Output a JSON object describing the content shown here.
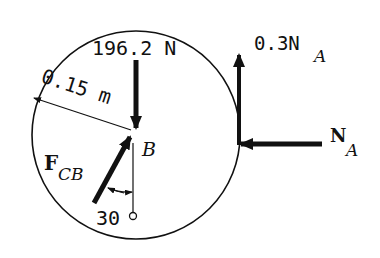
{
  "diagram": {
    "type": "free-body-diagram",
    "body": "circular disk",
    "labels": {
      "weight": "196.2 N",
      "radius": "0.15 m",
      "point": "B",
      "force_cb_main": "F",
      "force_cb_sub": "CB",
      "angle": "30",
      "angle_unit": "°",
      "friction_prefix": "0.3N",
      "friction_sub": "A",
      "normal_main": "N",
      "normal_sub": "A"
    },
    "forces": [
      {
        "name": "weight",
        "magnitude": "196.2 N",
        "direction": "down",
        "applied_at": "B"
      },
      {
        "name": "F_CB",
        "direction": "30° from vertical, toward B",
        "applied_at": "B"
      },
      {
        "name": "friction",
        "magnitude": "0.3N_A",
        "direction": "up",
        "applied_at": "A"
      },
      {
        "name": "normal",
        "magnitude": "N_A",
        "direction": "left",
        "applied_at": "A"
      }
    ],
    "colors": {
      "ink": "#111111",
      "background": "#ffffff"
    }
  }
}
